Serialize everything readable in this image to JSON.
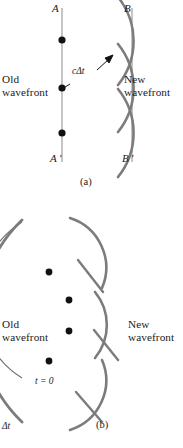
{
  "figure": {
    "panels": [
      {
        "id": "a",
        "caption": "(a)",
        "type": "plane-wavefront",
        "labels": {
          "top_left": "A",
          "top_right": "B",
          "bottom_left": "A ′",
          "bottom_right": "B ′",
          "old_wavefront_line1": "Old",
          "old_wavefront_line2": "wavefront",
          "new_wavefront_line1": "New",
          "new_wavefront_line2": "wavefront",
          "radius_label": "cΔt"
        },
        "source_point_count": 3,
        "wavelet_count": 3
      },
      {
        "id": "b",
        "caption": "(b)",
        "type": "spherical-wavefront",
        "labels": {
          "old_wavefront_line1": "Old",
          "old_wavefront_line2": "wavefront",
          "new_wavefront_line1": "New",
          "new_wavefront_line2": "wavefront",
          "time_initial": "t = 0",
          "time_delta": "Δt"
        },
        "source_point_count": 4,
        "wavelet_count": 3
      }
    ]
  },
  "colors": {
    "background": "#ffffff",
    "text": "#1a1a1a",
    "wavefront_line": "#adadad",
    "wavelet_arc": "#7c7c7c",
    "thin_arc": "#6e6e6e",
    "source_point": "#111111",
    "arrow": "#111111"
  }
}
